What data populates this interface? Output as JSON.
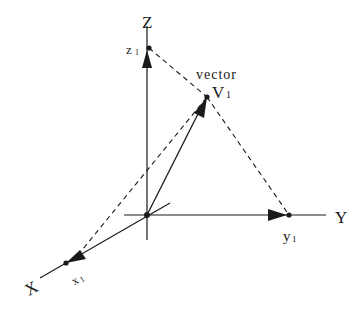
{
  "diagram": {
    "type": "3d-vector-decomposition",
    "colors": {
      "ink": "#1a1a1a",
      "background": "#ffffff"
    },
    "axes": [
      {
        "name": "Z",
        "label": "Z"
      },
      {
        "name": "Y",
        "label": "Y"
      },
      {
        "name": "X",
        "label": "X"
      }
    ],
    "points": {
      "z1": {
        "label": "z",
        "subscript": "1"
      },
      "y1": {
        "label": "y",
        "subscript": "1"
      },
      "x1": {
        "label": "x",
        "subscript": "1"
      },
      "v1": {
        "label": "V",
        "subscript": "1"
      }
    },
    "vector_caption": "vector"
  }
}
